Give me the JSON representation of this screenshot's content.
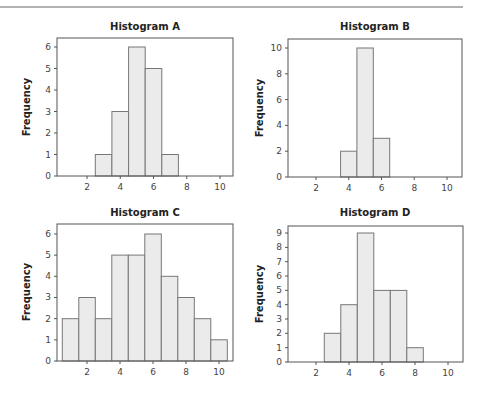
{
  "chart_data": [
    {
      "type": "bar",
      "title": "Histogram A",
      "xlabel": "",
      "ylabel": "Frequency",
      "bin_centers": [
        3,
        4,
        5,
        6,
        7
      ],
      "values": [
        1,
        3,
        6,
        5,
        1
      ],
      "bin_width": 1,
      "xticks": [
        2,
        4,
        6,
        8,
        10
      ],
      "yticks": [
        0,
        1,
        2,
        3,
        4,
        5,
        6
      ],
      "xlim": [
        0.2,
        10.8
      ],
      "ylim": [
        0,
        6.4
      ],
      "grid": false,
      "legend": null
    },
    {
      "type": "bar",
      "title": "Histogram B",
      "xlabel": "",
      "ylabel": "Frequency",
      "bin_centers": [
        4,
        5,
        6
      ],
      "values": [
        2,
        10,
        3
      ],
      "bin_width": 1,
      "xticks": [
        2,
        4,
        6,
        8,
        10
      ],
      "yticks": [
        0,
        2,
        4,
        6,
        8,
        10
      ],
      "xlim": [
        0.2,
        10.8
      ],
      "ylim": [
        0,
        10.7
      ],
      "grid": false,
      "legend": null
    },
    {
      "type": "bar",
      "title": "Histogram C",
      "xlabel": "",
      "ylabel": "Frequency",
      "bin_centers": [
        1,
        2,
        3,
        4,
        5,
        6,
        7,
        8,
        9,
        10
      ],
      "values": [
        2,
        3,
        2,
        5,
        5,
        6,
        4,
        3,
        2,
        1
      ],
      "bin_width": 1,
      "xticks": [
        2,
        4,
        6,
        8,
        10
      ],
      "yticks": [
        0,
        1,
        2,
        3,
        4,
        5,
        6
      ],
      "xlim": [
        0.2,
        10.8
      ],
      "ylim": [
        0,
        6.5
      ],
      "grid": false,
      "legend": null
    },
    {
      "type": "bar",
      "title": "Histogram D",
      "xlabel": "",
      "ylabel": "Frequency",
      "bin_centers": [
        3,
        4,
        5,
        6,
        7,
        8
      ],
      "values": [
        2,
        4,
        9,
        5,
        5,
        1
      ],
      "bin_width": 1,
      "xticks": [
        2,
        4,
        6,
        8,
        10
      ],
      "yticks": [
        0,
        1,
        2,
        3,
        4,
        5,
        6,
        7,
        8,
        9
      ],
      "xlim": [
        0.2,
        10.8
      ],
      "ylim": [
        0,
        9.5
      ],
      "grid": false,
      "legend": null
    }
  ]
}
